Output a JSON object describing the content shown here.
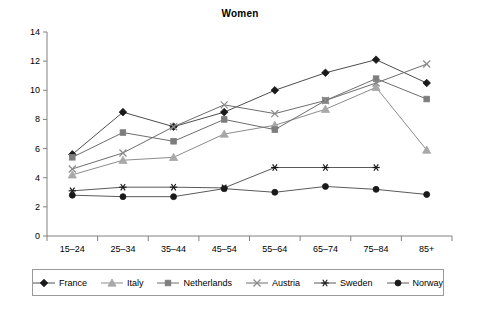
{
  "chart_data": {
    "type": "line",
    "title": "Women",
    "xlabel": "",
    "ylabel": "",
    "ylim": [
      0,
      14
    ],
    "yticks": [
      0,
      2,
      4,
      6,
      8,
      10,
      12,
      14
    ],
    "grid": false,
    "legend_position": "bottom",
    "categories": [
      "15–24",
      "25–34",
      "35–44",
      "45–54",
      "55–64",
      "65–74",
      "75–84",
      "85+"
    ],
    "series": [
      {
        "name": "France",
        "marker": "diamond",
        "color": "#1a1a1a",
        "line_color": "#4d4d4d",
        "values": [
          5.6,
          8.5,
          7.5,
          8.5,
          10.0,
          11.2,
          12.1,
          10.5
        ]
      },
      {
        "name": "Italy",
        "marker": "triangle",
        "color": "#a8a8a8",
        "line_color": "#8c8c8c",
        "values": [
          4.2,
          5.2,
          5.4,
          7.0,
          7.6,
          8.7,
          10.2,
          5.9
        ]
      },
      {
        "name": "Netherlands",
        "marker": "square",
        "color": "#7d7d7d",
        "line_color": "#6e6e6e",
        "values": [
          5.4,
          7.1,
          6.5,
          8.0,
          7.3,
          9.3,
          10.8,
          9.4
        ]
      },
      {
        "name": "Austria",
        "marker": "cross",
        "color": "#8a8a8a",
        "line_color": "#6e6e6e",
        "values": [
          4.6,
          5.7,
          7.5,
          9.0,
          8.4,
          9.3,
          10.5,
          11.8
        ]
      },
      {
        "name": "Sweden",
        "marker": "asterisk",
        "color": "#1a1a1a",
        "line_color": "#5a5a5a",
        "values": [
          3.1,
          3.35,
          3.35,
          3.3,
          4.7,
          4.7,
          4.7,
          null
        ]
      },
      {
        "name": "Norway",
        "marker": "circle",
        "color": "#1a1a1a",
        "line_color": "#5a5a5a",
        "values": [
          2.8,
          2.7,
          2.7,
          3.25,
          3.0,
          3.4,
          3.2,
          2.85
        ]
      }
    ]
  },
  "axis": {
    "y_tick_labels": [
      "0",
      "2",
      "4",
      "6",
      "8",
      "10",
      "12",
      "14"
    ],
    "x_tick_labels": [
      "15–24",
      "25–34",
      "35–44",
      "45–54",
      "55–64",
      "65–74",
      "75–84",
      "85+"
    ]
  },
  "legend": {
    "entries": [
      {
        "label": "France"
      },
      {
        "label": "Italy"
      },
      {
        "label": "Netherlands"
      },
      {
        "label": "Austria"
      },
      {
        "label": "Sweden"
      },
      {
        "label": "Norway"
      }
    ]
  },
  "colors": {
    "axis": "#808080",
    "text": "#000000",
    "legend_border": "#9a9a9a",
    "background": "#ffffff"
  }
}
